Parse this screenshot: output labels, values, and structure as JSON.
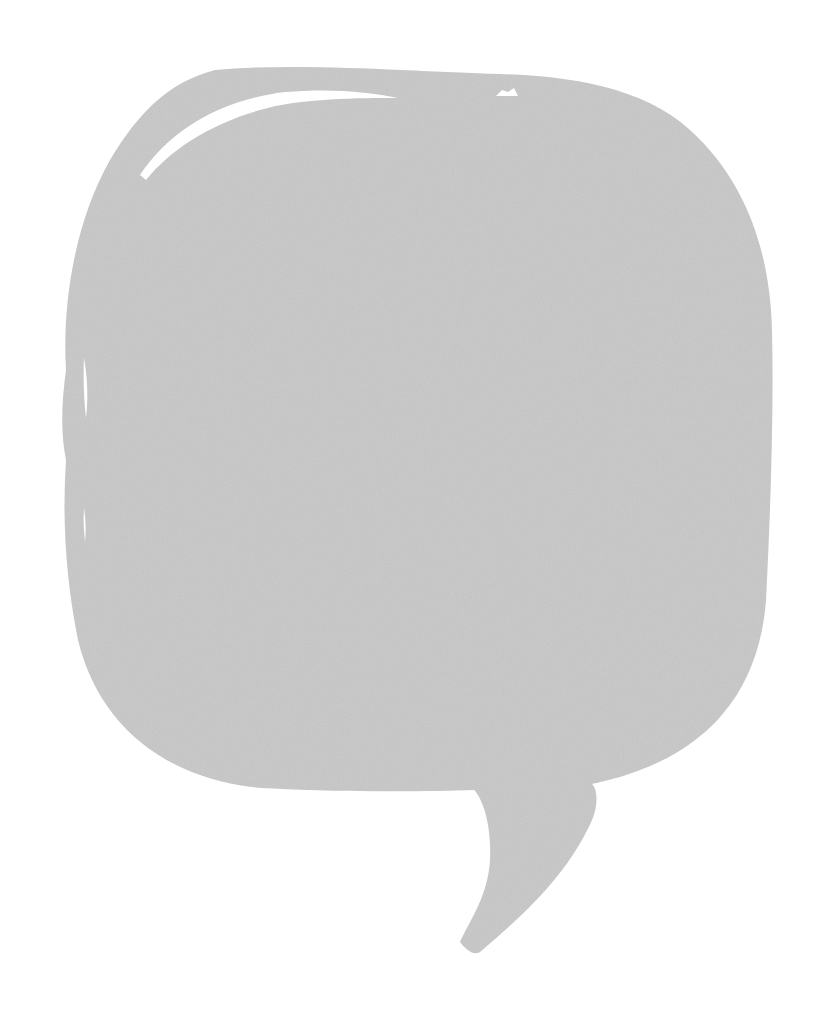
{
  "image": {
    "subject": "speech-bubble",
    "background_color": "#ffffff",
    "fill_color": "#c8c8c8",
    "highlight_color": "#ffffff",
    "texture": "paper-grain"
  }
}
